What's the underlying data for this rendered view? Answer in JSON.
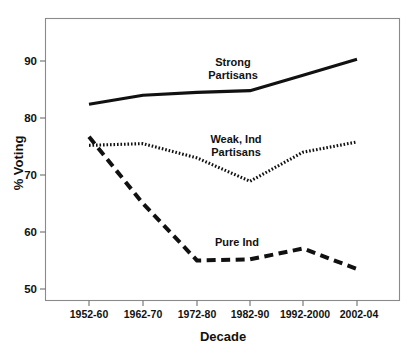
{
  "chart_data": {
    "type": "line",
    "title": "",
    "xlabel": "Decade",
    "ylabel": "% Voting",
    "categories": [
      "1952-60",
      "1962-70",
      "1972-80",
      "1982-90",
      "1992-2000",
      "2002-04"
    ],
    "ylim": [
      47,
      94
    ],
    "yticks": [
      50,
      60,
      70,
      80,
      90
    ],
    "ytick_labels": [
      "50",
      "60",
      "70",
      "80",
      "90"
    ],
    "grid": false,
    "legend_position": "inline-annotations",
    "series": [
      {
        "name": "Strong Partisans",
        "label": "Strong\nPartisans",
        "label_line1": "Strong",
        "label_line2": "Partisans",
        "style": "solid",
        "color": "#111111",
        "values": [
          82.4,
          84.0,
          84.5,
          84.8,
          87.5,
          90.3
        ]
      },
      {
        "name": "Weak, Ind Partisans",
        "label": "Weak, Ind\nPartisans",
        "label_line1": "Weak, Ind",
        "label_line2": "Partisans",
        "style": "dotted",
        "color": "#111111",
        "values": [
          75.2,
          75.5,
          73.0,
          68.9,
          74.0,
          75.8
        ]
      },
      {
        "name": "Pure Ind",
        "label": "Pure Ind",
        "label_line1": "Pure Ind",
        "label_line2": "",
        "style": "dashed",
        "color": "#111111",
        "values": [
          76.7,
          65.0,
          55.0,
          55.2,
          57.1,
          53.5
        ]
      }
    ]
  },
  "axes": {
    "x_title": "Decade",
    "y_title": "% Voting"
  },
  "annotations": {
    "strong_partisans_line1": "Strong",
    "strong_partisans_line2": "Partisans",
    "weak_ind_line1": "Weak, Ind",
    "weak_ind_line2": "Partisans",
    "pure_ind": "Pure Ind"
  },
  "ticks": {
    "y": [
      "90",
      "80",
      "70",
      "60",
      "50"
    ],
    "x": [
      "1952-60",
      "1962-70",
      "1972-80",
      "1982-90",
      "1992-2000",
      "2002-04"
    ]
  }
}
